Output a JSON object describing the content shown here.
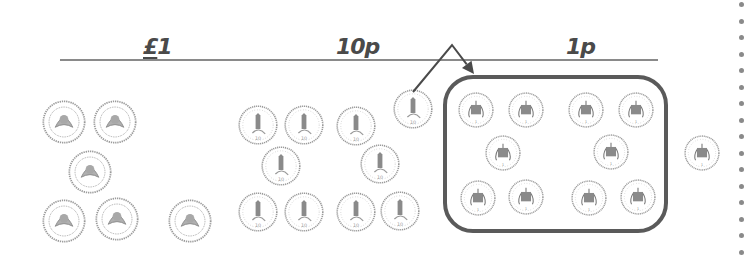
{
  "headings": [
    {
      "id": "pound",
      "symbol": "£",
      "text": "1",
      "x": 143,
      "y": 36
    },
    {
      "id": "ten-pence",
      "symbol": "",
      "text": "10p",
      "x": 336,
      "y": 36
    },
    {
      "id": "one-penny",
      "symbol": "",
      "text": "1p",
      "x": 566,
      "y": 36
    }
  ],
  "rule": {
    "x1": 60,
    "x2": 658,
    "y": 59,
    "color": "#8a8a8a"
  },
  "colors": {
    "ink": "#4a4a4a",
    "coin_line": "#9a9a9a",
    "coin_fill": "#ffffff",
    "box_border": "#5a5a5a",
    "dots": "#8a8a8a"
  },
  "coins": {
    "pound": {
      "radius": 22,
      "count": 6,
      "centers": [
        [
          64,
          122
        ],
        [
          115,
          122
        ],
        [
          90,
          172
        ],
        [
          64,
          221
        ],
        [
          117,
          219
        ],
        [
          190,
          221
        ]
      ]
    },
    "ten_pence": {
      "radius": 20,
      "count": 10,
      "centers": [
        [
          258,
          125
        ],
        [
          304,
          125
        ],
        [
          356,
          126
        ],
        [
          413,
          109
        ],
        [
          281,
          166
        ],
        [
          380,
          164
        ],
        [
          258,
          212
        ],
        [
          304,
          212
        ],
        [
          356,
          212
        ],
        [
          400,
          211
        ]
      ]
    },
    "one_penny_in_box": {
      "radius": 18,
      "count": 10,
      "centers": [
        [
          476,
          110
        ],
        [
          526,
          110
        ],
        [
          586,
          110
        ],
        [
          636,
          110
        ],
        [
          503,
          153
        ],
        [
          611,
          152
        ],
        [
          478,
          198
        ],
        [
          526,
          197
        ],
        [
          589,
          198
        ],
        [
          638,
          197
        ]
      ]
    },
    "one_penny_outside": {
      "radius": 18,
      "count": 1,
      "centers": [
        [
          702,
          153
        ]
      ]
    }
  },
  "box": {
    "x": 443,
    "y": 75,
    "width": 225,
    "height": 158,
    "border": 4,
    "radius": 30
  },
  "arrow": {
    "from": [
      413,
      92
    ],
    "peak": [
      452,
      45
    ],
    "to": [
      474,
      74
    ]
  },
  "dotted_line": {
    "x": 741,
    "y_start": 2,
    "spacing": 16.5,
    "count": 16
  }
}
